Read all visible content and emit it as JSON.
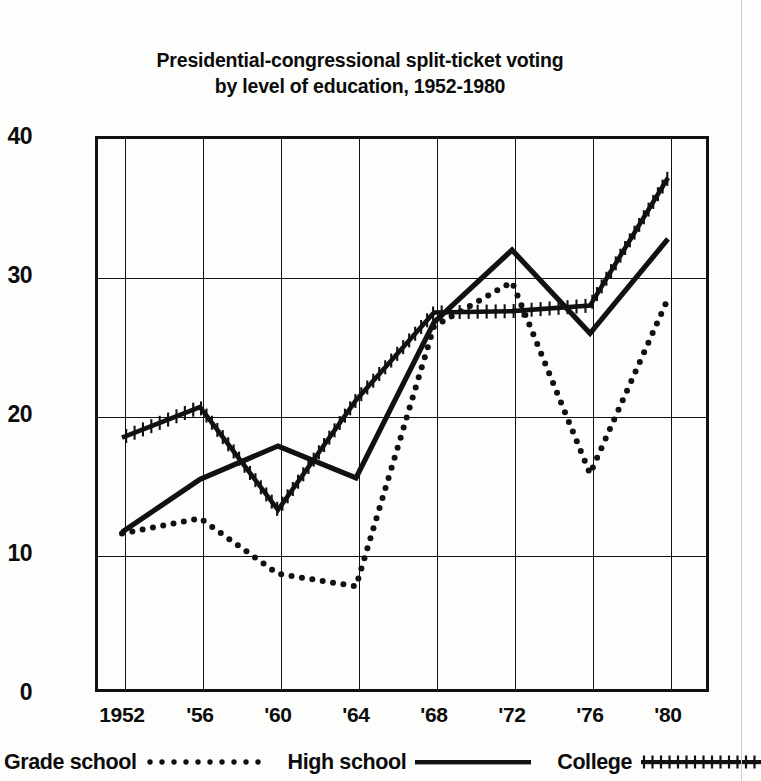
{
  "chart_data": {
    "type": "line",
    "title": "Presidential-congressional split-ticket voting by level of education, 1952-1980",
    "title_line1": "Presidential-congressional split-ticket voting",
    "title_line2": "by level of education, 1952-1980",
    "xlabel": "",
    "ylabel": "",
    "categories": [
      "1952",
      "'56",
      "'60",
      "'64",
      "'68",
      "'72",
      "'76",
      "'80"
    ],
    "x_values": [
      1952,
      1956,
      1960,
      1964,
      1968,
      1972,
      1976,
      1980
    ],
    "x_tick_labels": [
      "1952",
      "'56",
      "'60",
      "'64",
      "'68",
      "'72",
      "'76",
      "'80"
    ],
    "y_tick_labels": [
      "0",
      "10",
      "20",
      "30",
      "40"
    ],
    "y_ticks": [
      0,
      10,
      20,
      30,
      40
    ],
    "ylim": [
      0,
      40
    ],
    "grid": "both",
    "legend_position": "bottom",
    "series": [
      {
        "name": "Grade school",
        "style": "dotted",
        "color": "#111111",
        "values": [
          11.4,
          12.5,
          8.5,
          7.6,
          26.3,
          29.5,
          15.7,
          28.3
        ]
      },
      {
        "name": "High school",
        "style": "solid",
        "color": "#111111",
        "values": [
          11.5,
          15.3,
          17.7,
          15.4,
          26.6,
          31.8,
          25.8,
          32.6
        ]
      },
      {
        "name": "College",
        "style": "cross-hatched",
        "color": "#111111",
        "values": [
          18.3,
          20.5,
          13.1,
          21.0,
          27.3,
          27.4,
          27.8,
          37.0
        ]
      }
    ]
  },
  "legend": {
    "items": [
      {
        "label": "Grade school",
        "marker": "dotted-line-swatch"
      },
      {
        "label": "High school",
        "marker": "solid-line-swatch"
      },
      {
        "label": "College",
        "marker": "hatched-line-swatch"
      }
    ]
  }
}
